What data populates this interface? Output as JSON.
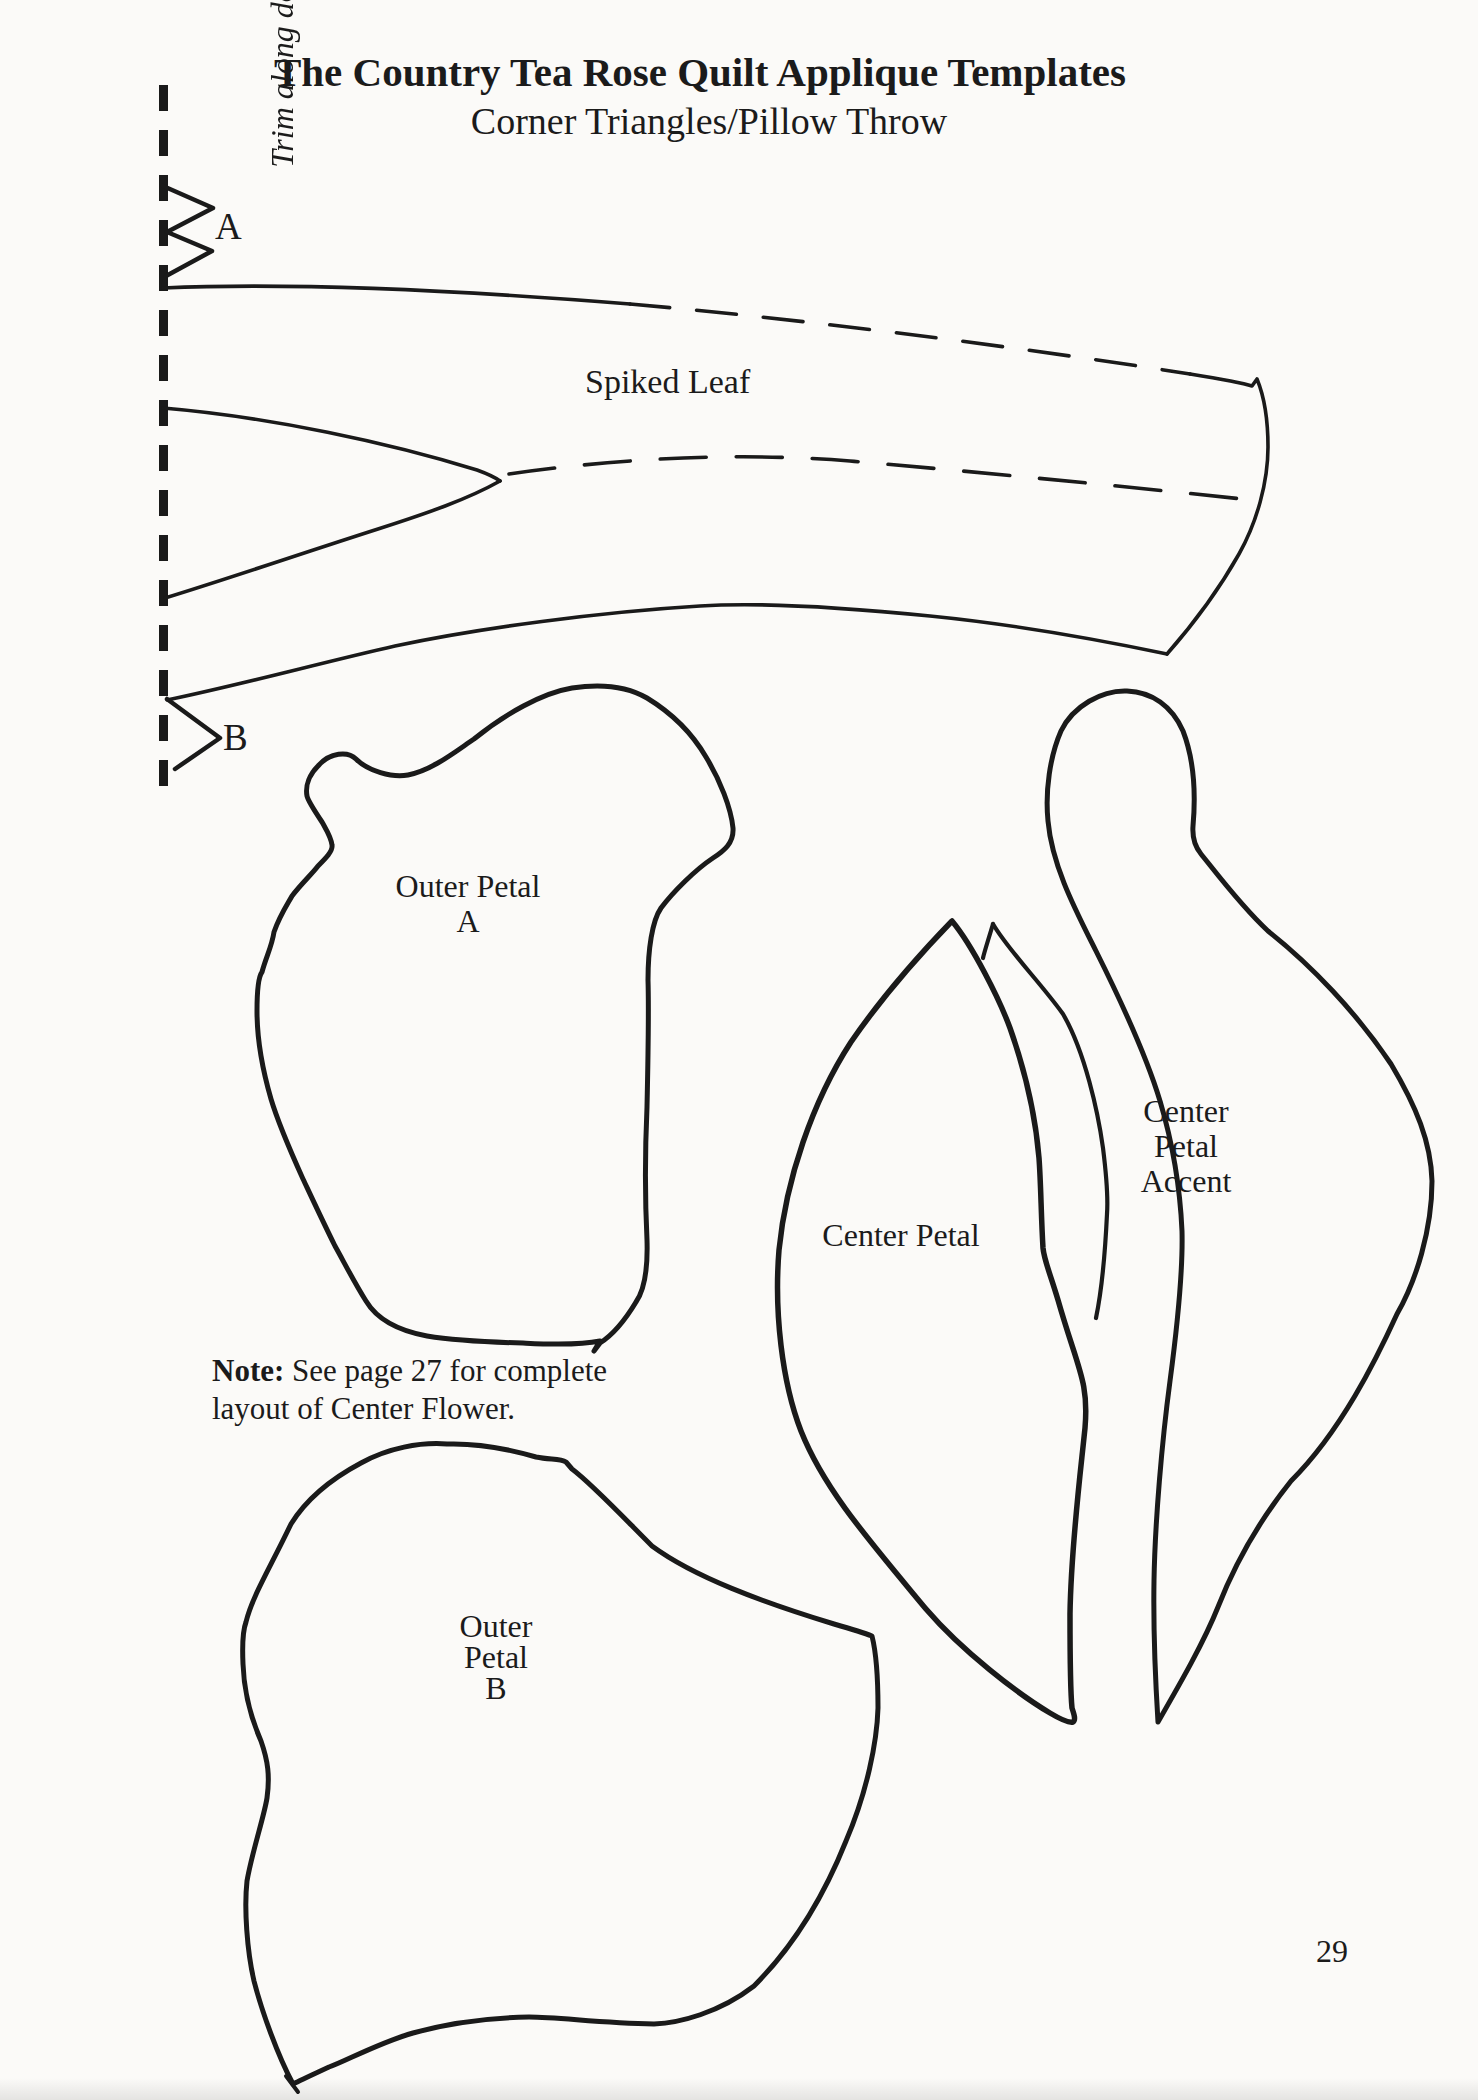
{
  "page": {
    "title": "The Country Tea Rose Quilt Applique Templates",
    "subtitle": "Corner Triangles/Pillow Throw",
    "trim_instruction": "Trim along dotted line.",
    "page_number": "29"
  },
  "markers": {
    "a": "A",
    "b": "B"
  },
  "note": {
    "label": "Note:",
    "line1": "See page 27 for complete",
    "line2": "layout of Center Flower."
  },
  "templates": {
    "spiked_leaf": {
      "label": "Spiked Leaf"
    },
    "outer_petal_a": {
      "lines": [
        "Outer Petal",
        "A"
      ]
    },
    "center_petal": {
      "label": "Center Petal"
    },
    "center_petal_accent": {
      "lines": [
        "Center",
        "Petal",
        "Accent"
      ]
    },
    "outer_petal_b": {
      "lines": [
        "Outer",
        "Petal",
        "B"
      ]
    }
  },
  "colors": {
    "ink": "#1a1a1a",
    "paper": "#fbfaf8"
  }
}
